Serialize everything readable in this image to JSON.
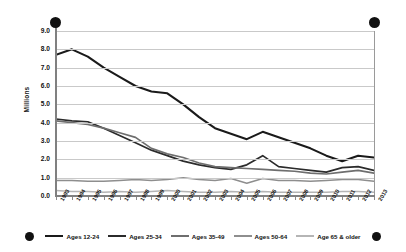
{
  "chart_data": {
    "type": "line",
    "title": "",
    "xlabel": "",
    "ylabel": "Millions",
    "ylim": [
      0.0,
      9.0
    ],
    "ytick_step": 1.0,
    "grid": true,
    "legend_position": "bottom",
    "ytick_labels": [
      "9.0",
      "8.0",
      "7.0",
      "6.0",
      "5.0",
      "4.0",
      "3.0",
      "2.0",
      "1.0",
      "0.0"
    ],
    "ytick_values": [
      9.0,
      8.0,
      7.0,
      6.0,
      5.0,
      4.0,
      3.0,
      2.0,
      1.0,
      0.0
    ],
    "categories": [
      "1993",
      "1994",
      "1995",
      "1996",
      "1997",
      "1998",
      "1999",
      "2000",
      "2001",
      "2002",
      "2003",
      "2004",
      "2005",
      "2006",
      "2007",
      "2008",
      "2009",
      "2010",
      "2011",
      "2012",
      "2013"
    ],
    "series": [
      {
        "name": "Ages 12-24",
        "color": "#1a1a1a",
        "width": 2.1,
        "values": [
          7.7,
          8.0,
          7.6,
          7.0,
          6.5,
          6.0,
          5.7,
          5.6,
          5.0,
          4.3,
          3.7,
          3.4,
          3.1,
          3.5,
          3.2,
          2.9,
          2.6,
          2.2,
          1.9,
          2.2,
          2.1
        ]
      },
      {
        "name": "Ages 25-34",
        "color": "#2b2b2b",
        "width": 1.7,
        "values": [
          4.2,
          4.1,
          4.05,
          3.7,
          3.3,
          2.9,
          2.5,
          2.2,
          1.9,
          1.7,
          1.55,
          1.45,
          1.7,
          2.2,
          1.6,
          1.5,
          1.4,
          1.3,
          1.55,
          1.6,
          1.4
        ]
      },
      {
        "name": "Ages 35-49",
        "color": "#6e6e6e",
        "width": 1.7,
        "values": [
          4.1,
          4.0,
          3.9,
          3.7,
          3.45,
          3.2,
          2.6,
          2.3,
          2.1,
          1.8,
          1.6,
          1.55,
          1.5,
          1.45,
          1.4,
          1.35,
          1.25,
          1.2,
          1.3,
          1.4,
          1.25
        ]
      },
      {
        "name": "Ages 50-64",
        "color": "#8e8e8e",
        "width": 1.5,
        "values": [
          0.85,
          0.85,
          0.8,
          0.8,
          0.85,
          0.9,
          0.85,
          0.9,
          1.0,
          0.9,
          0.85,
          0.95,
          0.7,
          0.95,
          0.85,
          0.85,
          0.8,
          0.85,
          0.9,
          0.9,
          0.8
        ]
      },
      {
        "name": "Age 65 & older",
        "color": "#b5b5b5",
        "width": 1.5,
        "values": [
          0.3,
          0.25,
          0.25,
          0.2,
          0.25,
          0.2,
          0.25,
          0.3,
          0.25,
          0.2,
          0.2,
          0.25,
          0.2,
          0.25,
          0.2,
          0.2,
          0.2,
          0.2,
          0.25,
          0.25,
          0.2
        ]
      }
    ]
  }
}
